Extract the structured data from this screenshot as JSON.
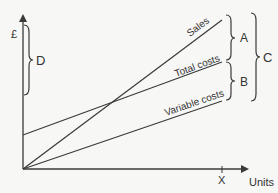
{
  "diagram": {
    "type": "break-even chart",
    "axes": {
      "y_label": "£",
      "x_label": "Units",
      "x_marker": "X"
    },
    "lines": [
      {
        "name": "sales",
        "label": "Sales"
      },
      {
        "name": "total-costs",
        "label": "Total costs"
      },
      {
        "name": "variable-costs",
        "label": "Variable costs"
      }
    ],
    "braces": {
      "a": "A",
      "b": "B",
      "c": "C",
      "d": "D"
    },
    "colors": {
      "line": "#3a3a3a",
      "background": "#f7f7f6",
      "text": "#333333"
    }
  }
}
